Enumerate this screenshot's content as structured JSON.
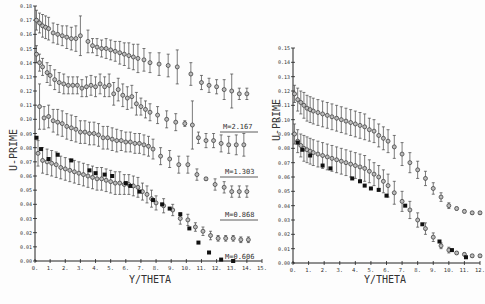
{
  "chart_data": [
    {
      "type": "scatter",
      "title": "",
      "xlabel": "Y/THETA",
      "ylabel": "U-PRIME",
      "xlim": [
        0,
        15
      ],
      "ylim": [
        0.0,
        0.18
      ],
      "xticks": [
        "0.",
        "1.",
        "2.",
        "3.",
        "4.",
        "5.",
        "6.",
        "7.",
        "8.",
        "9.",
        "10.",
        "11.",
        "12.",
        "13.",
        "14.",
        "15."
      ],
      "yticks": [
        "0.00",
        "0.01",
        "0.02",
        "0.03",
        "0.04",
        "0.05",
        "0.06",
        "0.07",
        "0.08",
        "0.09",
        "0.10",
        "0.11",
        "0.12",
        "0.13",
        "0.14",
        "0.15",
        "0.16",
        "0.17",
        "0.18"
      ],
      "grid": false,
      "series": [
        {
          "name": "M=2.167",
          "marker": "circle-errorbar",
          "x": [
            0.1,
            0.3,
            0.5,
            0.7,
            0.9,
            1.2,
            1.5,
            1.8,
            2.1,
            2.4,
            2.7,
            3.0,
            3.5,
            3.8,
            4.1,
            4.4,
            4.7,
            5.0,
            5.3,
            5.6,
            5.9,
            6.2,
            6.5,
            6.8,
            7.2,
            7.6,
            8.2,
            8.8,
            9.4,
            10.3,
            11.0,
            11.5,
            12.0,
            12.5,
            13.0,
            13.5,
            14.0
          ],
          "y": [
            0.17,
            0.168,
            0.166,
            0.165,
            0.164,
            0.161,
            0.16,
            0.159,
            0.158,
            0.157,
            0.157,
            0.159,
            0.155,
            0.152,
            0.151,
            0.15,
            0.15,
            0.149,
            0.148,
            0.147,
            0.146,
            0.145,
            0.144,
            0.143,
            0.142,
            0.14,
            0.139,
            0.138,
            0.137,
            0.132,
            0.126,
            0.124,
            0.123,
            0.121,
            0.12,
            0.118,
            0.118
          ],
          "err": [
            0.007,
            0.007,
            0.008,
            0.008,
            0.008,
            0.007,
            0.007,
            0.007,
            0.008,
            0.008,
            0.009,
            0.014,
            0.008,
            0.005,
            0.006,
            0.006,
            0.007,
            0.007,
            0.007,
            0.008,
            0.008,
            0.009,
            0.009,
            0.01,
            0.008,
            0.007,
            0.008,
            0.008,
            0.012,
            0.008,
            0.005,
            0.005,
            0.005,
            0.007,
            0.012,
            0.004,
            0.004
          ]
        },
        {
          "name": "M=1.303",
          "marker": "circle-errorbar",
          "x": [
            0.1,
            0.3,
            0.5,
            0.8,
            1.0,
            1.3,
            1.6,
            1.9,
            2.2,
            2.5,
            2.8,
            3.1,
            3.4,
            3.7,
            4.0,
            4.3,
            4.6,
            4.9,
            5.2,
            5.5,
            5.8,
            6.1,
            6.4,
            6.7,
            7.0,
            7.3,
            7.6,
            8.1,
            8.7,
            9.3,
            9.9,
            10.4,
            10.8,
            11.3,
            11.8,
            12.3,
            12.8,
            13.3,
            13.8
          ],
          "y": [
            0.146,
            0.14,
            0.137,
            0.133,
            0.131,
            0.128,
            0.126,
            0.125,
            0.124,
            0.124,
            0.124,
            0.122,
            0.123,
            0.124,
            0.123,
            0.125,
            0.123,
            0.124,
            0.118,
            0.121,
            0.117,
            0.115,
            0.116,
            0.111,
            0.109,
            0.107,
            0.105,
            0.103,
            0.1,
            0.098,
            0.097,
            0.096,
            0.087,
            0.085,
            0.085,
            0.083,
            0.082,
            0.082,
            0.082
          ],
          "err": [
            0.006,
            0.006,
            0.006,
            0.007,
            0.007,
            0.007,
            0.007,
            0.007,
            0.006,
            0.006,
            0.006,
            0.006,
            0.007,
            0.007,
            0.007,
            0.007,
            0.007,
            0.008,
            0.008,
            0.008,
            0.008,
            0.008,
            0.008,
            0.008,
            0.006,
            0.006,
            0.006,
            0.006,
            0.006,
            0.006,
            0.002,
            0.017,
            0.004,
            0.005,
            0.005,
            0.006,
            0.006,
            0.007,
            0.008
          ]
        },
        {
          "name": "M=0.868",
          "marker": "circle-errorbar",
          "x": [
            0.3,
            0.6,
            0.9,
            1.2,
            1.5,
            1.8,
            2.1,
            2.4,
            2.7,
            3.0,
            3.3,
            3.6,
            3.9,
            4.2,
            4.5,
            4.8,
            5.1,
            5.4,
            5.7,
            6.0,
            6.3,
            6.6,
            6.9,
            7.2,
            7.5,
            7.8,
            8.3,
            8.9,
            9.5,
            10.1,
            10.7,
            11.3,
            11.9,
            12.5,
            13.0,
            13.5,
            14.0
          ],
          "y": [
            0.109,
            0.101,
            0.102,
            0.099,
            0.098,
            0.097,
            0.095,
            0.094,
            0.093,
            0.091,
            0.091,
            0.09,
            0.09,
            0.089,
            0.087,
            0.087,
            0.086,
            0.085,
            0.085,
            0.084,
            0.084,
            0.083,
            0.083,
            0.082,
            0.081,
            0.079,
            0.074,
            0.072,
            0.068,
            0.068,
            0.061,
            0.058,
            0.054,
            0.052,
            0.049,
            0.049,
            0.049
          ],
          "err": [
            0.016,
            0.008,
            0.008,
            0.008,
            0.009,
            0.009,
            0.009,
            0.009,
            0.009,
            0.008,
            0.008,
            0.008,
            0.008,
            0.008,
            0.008,
            0.008,
            0.008,
            0.008,
            0.007,
            0.007,
            0.007,
            0.007,
            0.007,
            0.007,
            0.007,
            0.007,
            0.006,
            0.006,
            0.006,
            0.006,
            0.004,
            0.001,
            0.004,
            0.004,
            0.004,
            0.004,
            0.004
          ]
        },
        {
          "name": "M=0.606",
          "marker": "circle-errorbar",
          "x": [
            0.2,
            0.5,
            0.8,
            1.1,
            1.4,
            1.7,
            2.0,
            2.3,
            2.6,
            2.9,
            3.2,
            3.5,
            3.8,
            4.1,
            4.4,
            4.7,
            5.0,
            5.3,
            5.6,
            5.9,
            6.2,
            6.5,
            6.8,
            7.1,
            7.4,
            7.7,
            8.0,
            8.5,
            9.1,
            9.6,
            10.1,
            10.6,
            11.1,
            11.6,
            12.1,
            12.6,
            13.1,
            13.6,
            14.1
          ],
          "y": [
            0.076,
            0.071,
            0.07,
            0.069,
            0.068,
            0.066,
            0.065,
            0.064,
            0.063,
            0.062,
            0.061,
            0.06,
            0.059,
            0.058,
            0.058,
            0.057,
            0.056,
            0.055,
            0.055,
            0.054,
            0.054,
            0.053,
            0.052,
            0.049,
            0.047,
            0.044,
            0.041,
            0.039,
            0.036,
            0.03,
            0.029,
            0.024,
            0.021,
            0.018,
            0.016,
            0.016,
            0.016,
            0.015,
            0.015
          ],
          "err": [
            0.009,
            0.009,
            0.009,
            0.009,
            0.009,
            0.008,
            0.008,
            0.008,
            0.008,
            0.008,
            0.008,
            0.008,
            0.008,
            0.008,
            0.008,
            0.008,
            0.008,
            0.008,
            0.008,
            0.007,
            0.007,
            0.007,
            0.007,
            0.006,
            0.006,
            0.006,
            0.005,
            0.005,
            0.004,
            0.004,
            0.004,
            0.003,
            0.003,
            0.003,
            0.002,
            0.002,
            0.002,
            0.002,
            0.002
          ]
        },
        {
          "name": "M=0.606 (solid squares)",
          "marker": "square",
          "x": [
            0.1,
            0.4,
            0.9,
            1.5,
            2.4,
            3.6,
            4.0,
            4.6,
            5.1,
            6.0,
            6.3,
            6.9,
            7.8,
            8.4,
            8.9,
            9.6,
            10.2,
            10.8,
            11.5,
            12.3,
            13.1
          ],
          "y": [
            0.087,
            0.079,
            0.072,
            0.075,
            0.071,
            0.064,
            0.062,
            0.061,
            0.06,
            0.055,
            0.053,
            0.049,
            0.043,
            0.04,
            0.037,
            0.033,
            0.023,
            0.013,
            0.006,
            0.001,
            0.0
          ]
        }
      ],
      "legend": {
        "position": "right-inline-labels",
        "entries": [
          "M=2.167",
          "M=1.303",
          "M=0.868",
          "M=0.606"
        ]
      }
    },
    {
      "type": "scatter",
      "title": "",
      "xlabel": "Y/THETA",
      "ylabel": "U-PRIME",
      "xlim": [
        0,
        12
      ],
      "ylim": [
        0.0,
        0.15
      ],
      "xticks": [
        "0.",
        "1.",
        "2.",
        "3.",
        "4.",
        "5.",
        "6.",
        "7.",
        "8.",
        "9.",
        "10.",
        "11.",
        "12."
      ],
      "yticks": [
        "0.00",
        "0.01",
        "0.02",
        "0.03",
        "0.04",
        "0.05",
        "0.06",
        "0.07",
        "0.08",
        "0.09",
        "0.10",
        "0.11",
        "0.12",
        "0.13",
        "0.14",
        "0.15"
      ],
      "grid": false,
      "series": [
        {
          "name": "upper",
          "marker": "circle-errorbar",
          "x": [
            0.1,
            0.3,
            0.5,
            0.7,
            0.9,
            1.1,
            1.3,
            1.6,
            1.9,
            2.2,
            2.5,
            2.8,
            3.1,
            3.4,
            3.7,
            4.0,
            4.3,
            4.6,
            4.9,
            5.2,
            5.5,
            5.8,
            6.1,
            6.5,
            7.0,
            7.5,
            8.0,
            8.5,
            9.0,
            9.5,
            10.0,
            10.5,
            11.0,
            11.5,
            12.0
          ],
          "y": [
            0.118,
            0.114,
            0.112,
            0.11,
            0.108,
            0.107,
            0.106,
            0.105,
            0.104,
            0.103,
            0.102,
            0.101,
            0.1,
            0.099,
            0.098,
            0.097,
            0.096,
            0.095,
            0.093,
            0.092,
            0.089,
            0.087,
            0.085,
            0.081,
            0.076,
            0.07,
            0.065,
            0.059,
            0.052,
            0.046,
            0.04,
            0.038,
            0.036,
            0.035,
            0.035
          ],
          "err": [
            0.006,
            0.008,
            0.008,
            0.009,
            0.009,
            0.009,
            0.009,
            0.009,
            0.009,
            0.009,
            0.009,
            0.009,
            0.009,
            0.009,
            0.009,
            0.009,
            0.009,
            0.009,
            0.008,
            0.008,
            0.008,
            0.008,
            0.008,
            0.008,
            0.008,
            0.007,
            0.006,
            0.005,
            0.004,
            0.003,
            0.002,
            0.001,
            0.001,
            0.001,
            0.001
          ]
        },
        {
          "name": "lower",
          "marker": "circle-errorbar",
          "x": [
            0.1,
            0.3,
            0.5,
            0.7,
            0.9,
            1.1,
            1.3,
            1.6,
            1.9,
            2.2,
            2.5,
            2.8,
            3.1,
            3.4,
            3.7,
            4.0,
            4.3,
            4.6,
            4.9,
            5.2,
            5.5,
            5.8,
            6.1,
            6.5,
            7.0,
            7.5,
            8.0,
            8.5,
            9.0,
            9.5,
            10.0,
            10.5,
            11.0,
            11.5,
            12.0
          ],
          "y": [
            0.09,
            0.085,
            0.082,
            0.08,
            0.079,
            0.078,
            0.077,
            0.076,
            0.075,
            0.074,
            0.073,
            0.072,
            0.071,
            0.07,
            0.069,
            0.068,
            0.067,
            0.066,
            0.064,
            0.062,
            0.06,
            0.057,
            0.054,
            0.049,
            0.043,
            0.037,
            0.03,
            0.024,
            0.018,
            0.012,
            0.009,
            0.007,
            0.006,
            0.005,
            0.005
          ],
          "err": [
            0.007,
            0.008,
            0.008,
            0.009,
            0.009,
            0.009,
            0.009,
            0.009,
            0.009,
            0.009,
            0.009,
            0.009,
            0.009,
            0.009,
            0.009,
            0.009,
            0.009,
            0.009,
            0.008,
            0.008,
            0.008,
            0.008,
            0.008,
            0.008,
            0.007,
            0.006,
            0.005,
            0.004,
            0.003,
            0.002,
            0.002,
            0.001,
            0.001,
            0.001,
            0.001
          ]
        },
        {
          "name": "solid squares",
          "marker": "square",
          "x": [
            0.3,
            0.6,
            1.1,
            1.9,
            2.4,
            3.8,
            4.3,
            4.6,
            5.0,
            5.5,
            6.0,
            7.2,
            8.3,
            9.4,
            10.2,
            11.1
          ],
          "y": [
            0.084,
            0.079,
            0.075,
            0.068,
            0.066,
            0.059,
            0.057,
            0.054,
            0.052,
            0.051,
            0.047,
            0.04,
            0.027,
            0.015,
            0.009,
            0.004
          ]
        }
      ],
      "legend": {
        "position": "none",
        "entries": []
      }
    }
  ],
  "labels": {
    "left_ylabel": "U-PRIME",
    "left_xlabel": "Y/THETA",
    "right_ylabel": "U-PRIME",
    "right_xlabel": "Y/THETA",
    "m1": "M=2.167",
    "m2": "M=1.303",
    "m3": "M=0.868",
    "m4": "M=0.606"
  }
}
